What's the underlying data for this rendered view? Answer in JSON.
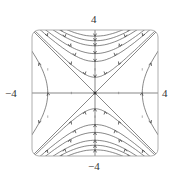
{
  "figure": {
    "type": "phase-portrait",
    "frame": {
      "xmin": -4,
      "xmax": 4,
      "ymin": -4,
      "ymax": 4,
      "corner_style": "rounded"
    },
    "labels": {
      "top": "4",
      "bottom": "−4",
      "left": "−4",
      "right": "4"
    },
    "separatrices": [
      "y = x",
      "y = -x"
    ],
    "axes": [
      "x-axis",
      "y-axis"
    ],
    "trajectory_families": [
      {
        "region": "top",
        "form": "y^2 - x^2 = c",
        "c_values": [
          1,
          4,
          6.25,
          9,
          11,
          13
        ]
      },
      {
        "region": "bottom",
        "form": "y^2 - x^2 = c",
        "c_values": [
          1,
          4,
          6.25,
          9,
          11,
          13
        ]
      },
      {
        "region": "left",
        "form": "x^2 - y^2 = c",
        "c_values": [
          9
        ]
      },
      {
        "region": "right",
        "form": "x^2 - y^2 = c",
        "c_values": [
          9
        ]
      }
    ],
    "colors": {
      "line": "#555555",
      "frame": "#888888",
      "arrow": "#444444",
      "text": "#333333"
    }
  }
}
